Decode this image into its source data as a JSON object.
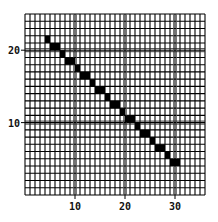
{
  "chart_data": {
    "type": "heatmap",
    "title": "",
    "xlabel": "",
    "ylabel": "",
    "grid": true,
    "xlim": [
      0,
      36
    ],
    "ylim": [
      0,
      25
    ],
    "x_ticks": [
      10,
      20,
      30
    ],
    "x_tick_labels": [
      "10",
      "20",
      "30"
    ],
    "y_ticks": [
      10,
      20
    ],
    "y_tick_labels": [
      "10",
      "20"
    ],
    "cell_color": "#000000",
    "grid_color": "#000000",
    "background": "#ffffff",
    "filled_cells": [
      {
        "x": 4,
        "y": 21,
        "w": 1
      },
      {
        "x": 5,
        "y": 20,
        "w": 2
      },
      {
        "x": 7,
        "y": 19,
        "w": 1
      },
      {
        "x": 8,
        "y": 18,
        "w": 2
      },
      {
        "x": 10,
        "y": 17,
        "w": 1
      },
      {
        "x": 11,
        "y": 16,
        "w": 2
      },
      {
        "x": 13,
        "y": 15,
        "w": 1
      },
      {
        "x": 14,
        "y": 14,
        "w": 2
      },
      {
        "x": 16,
        "y": 13,
        "w": 1
      },
      {
        "x": 17,
        "y": 12,
        "w": 2
      },
      {
        "x": 19,
        "y": 11,
        "w": 1
      },
      {
        "x": 20,
        "y": 10,
        "w": 2
      },
      {
        "x": 22,
        "y": 9,
        "w": 1
      },
      {
        "x": 23,
        "y": 8,
        "w": 2
      },
      {
        "x": 25,
        "y": 7,
        "w": 1
      },
      {
        "x": 26,
        "y": 6,
        "w": 2
      },
      {
        "x": 28,
        "y": 5,
        "w": 1
      },
      {
        "x": 29,
        "y": 4,
        "w": 2
      }
    ]
  }
}
